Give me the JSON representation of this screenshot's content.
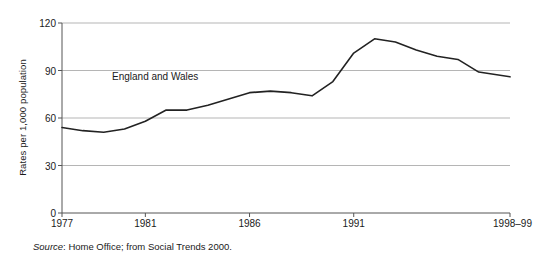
{
  "chart_data": {
    "type": "line",
    "title": "",
    "xlabel": "",
    "ylabel": "Rates per 1,000 population",
    "ylim": [
      0,
      120
    ],
    "yticks": [
      0,
      30,
      60,
      90,
      120
    ],
    "ytick_labels": [
      "0",
      "30",
      "60",
      "90",
      "120"
    ],
    "grid": true,
    "grid_axis": "y",
    "legend_position": "inline-annotation",
    "xtick_labels": [
      "1977",
      "1981",
      "1986",
      "1991",
      "1998–99"
    ],
    "xtick_values": [
      1977,
      1981,
      1986,
      1991,
      1998.5
    ],
    "xlim": [
      1977,
      1998.5
    ],
    "annotations": [
      {
        "text": "England and Wales",
        "x": 1981.8,
        "y": 86
      }
    ],
    "series": [
      {
        "name": "England and Wales",
        "color": "#222222",
        "x": [
          1977,
          1978,
          1979,
          1980,
          1981,
          1982,
          1983,
          1984,
          1985,
          1986,
          1987,
          1988,
          1989,
          1990,
          1991,
          1992,
          1993,
          1994,
          1995,
          1996,
          1997,
          1998.5
        ],
        "values": [
          54,
          52,
          51,
          53,
          58,
          65,
          65,
          68,
          72,
          76,
          77,
          76,
          74,
          83,
          101,
          110,
          108,
          103,
          99,
          97,
          89,
          86
        ]
      }
    ]
  },
  "annotation": {
    "series_label": "England and Wales"
  },
  "axes": {
    "y_title": "Rates per 1,000 population"
  },
  "source": {
    "prefix": "Source",
    "text": ": Home Office; from Social Trends 2000."
  }
}
